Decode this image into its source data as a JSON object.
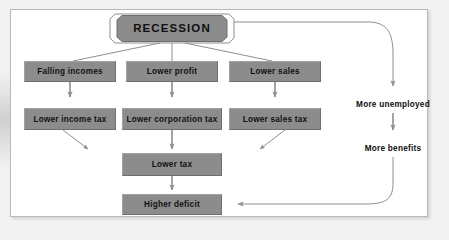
{
  "diagram": {
    "title_node": {
      "label": "RECESSION",
      "shape": "octagon-outlined",
      "fill": "#8c8c8c"
    },
    "row1": [
      {
        "label": "Falling incomes"
      },
      {
        "label": "Lower profit"
      },
      {
        "label": "Lower sales"
      }
    ],
    "row2": [
      {
        "label": "Lower income tax"
      },
      {
        "label": "Lower corporation tax"
      },
      {
        "label": "Lower sales tax"
      }
    ],
    "row3": [
      {
        "label": "Lower tax"
      }
    ],
    "row4": [
      {
        "label": "Higher deficit"
      }
    ],
    "side_labels": [
      {
        "label": "More unemployed"
      },
      {
        "label": "More benefits"
      }
    ],
    "colors": {
      "node_fill": "#8c8c8c",
      "node_text": "#111111",
      "connector": "#8e8e8e",
      "card_background": "#ffffff",
      "card_border": "#b9b9b9"
    },
    "connections": [
      {
        "from": "RECESSION",
        "to": "Falling incomes",
        "style": "line"
      },
      {
        "from": "RECESSION",
        "to": "Lower profit",
        "style": "line"
      },
      {
        "from": "RECESSION",
        "to": "Lower sales",
        "style": "line"
      },
      {
        "from": "RECESSION",
        "to": "More unemployed",
        "style": "curved-arrow"
      },
      {
        "from": "Falling incomes",
        "to": "Lower income tax",
        "style": "arrow"
      },
      {
        "from": "Lower profit",
        "to": "Lower corporation tax",
        "style": "arrow"
      },
      {
        "from": "Lower sales",
        "to": "Lower sales tax",
        "style": "arrow"
      },
      {
        "from": "Lower income tax",
        "to": "Lower tax",
        "style": "diagonal-arrow"
      },
      {
        "from": "Lower corporation tax",
        "to": "Lower tax",
        "style": "arrow"
      },
      {
        "from": "Lower sales tax",
        "to": "Lower tax",
        "style": "diagonal-arrow"
      },
      {
        "from": "Lower tax",
        "to": "Higher deficit",
        "style": "arrow"
      },
      {
        "from": "More unemployed",
        "to": "More benefits",
        "style": "arrow"
      },
      {
        "from": "More benefits",
        "to": "Higher deficit",
        "style": "curved-arrow"
      }
    ]
  }
}
